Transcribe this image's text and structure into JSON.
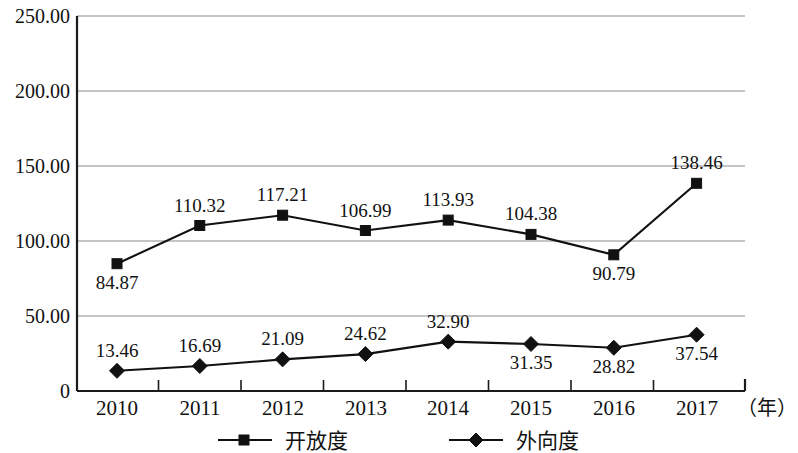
{
  "chart_data": {
    "type": "line",
    "title": "",
    "xlabel": "（年）",
    "ylabel": "",
    "categories": [
      "2010",
      "2011",
      "2012",
      "2013",
      "2014",
      "2015",
      "2016",
      "2017"
    ],
    "ylim": [
      0,
      250
    ],
    "yticks": [
      "0",
      "50.00",
      "100.00",
      "150.00",
      "200.00",
      "250.00"
    ],
    "ytick_values": [
      0,
      50,
      100,
      150,
      200,
      250
    ],
    "grid": "horizontal",
    "legend_position": "bottom",
    "series": [
      {
        "name": "开放度",
        "marker": "square",
        "values": [
          84.87,
          110.32,
          117.21,
          106.99,
          113.93,
          104.38,
          90.79,
          138.46
        ],
        "labels": [
          "84.87",
          "110.32",
          "117.21",
          "106.99",
          "113.93",
          "104.38",
          "90.79",
          "138.46"
        ],
        "label_positions": [
          "below",
          "above",
          "above",
          "above",
          "above",
          "above",
          "below",
          "above"
        ]
      },
      {
        "name": "外向度",
        "marker": "diamond",
        "values": [
          13.46,
          16.69,
          21.09,
          24.62,
          32.9,
          31.35,
          28.82,
          37.54
        ],
        "labels": [
          "13.46",
          "16.69",
          "21.09",
          "24.62",
          "32.90",
          "31.35",
          "28.82",
          "37.54"
        ],
        "label_positions": [
          "above",
          "above",
          "above",
          "above",
          "above",
          "below",
          "below",
          "below"
        ]
      }
    ]
  },
  "axis": {
    "unit_label": "（年）"
  },
  "legend": {
    "items": [
      {
        "label": "开放度",
        "marker": "square-marker-icon"
      },
      {
        "label": "外向度",
        "marker": "diamond-marker-icon"
      }
    ]
  }
}
